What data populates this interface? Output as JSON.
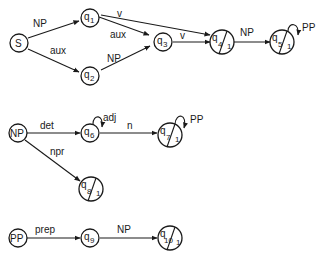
{
  "diagram": {
    "type": "augmented transition network",
    "networks": [
      {
        "name": "S",
        "nodes": [
          {
            "id": "S",
            "label": "S",
            "final": false
          },
          {
            "id": "q1",
            "label": "q",
            "sub": "1",
            "final": false
          },
          {
            "id": "q2",
            "label": "q",
            "sub": "2",
            "final": false
          },
          {
            "id": "q3",
            "label": "q",
            "sub": "3",
            "final": false
          },
          {
            "id": "q4",
            "label": "q",
            "sub": "4",
            "final": true,
            "final_mark": "1"
          },
          {
            "id": "q5",
            "label": "q",
            "sub": "5",
            "final": true,
            "final_mark": "1"
          }
        ],
        "edges": [
          {
            "from": "S",
            "to": "q1",
            "label": "NP"
          },
          {
            "from": "S",
            "to": "q2",
            "label": "aux"
          },
          {
            "from": "q1",
            "to": "q4",
            "label": "v"
          },
          {
            "from": "q1",
            "to": "q3",
            "label": "aux"
          },
          {
            "from": "q2",
            "to": "q3",
            "label": "NP"
          },
          {
            "from": "q3",
            "to": "q4",
            "label": "v"
          },
          {
            "from": "q4",
            "to": "q5",
            "label": "NP"
          },
          {
            "from": "q5",
            "to": "q5",
            "label": "PP"
          }
        ]
      },
      {
        "name": "NP",
        "nodes": [
          {
            "id": "NP",
            "label": "NP",
            "final": false
          },
          {
            "id": "q6",
            "label": "q",
            "sub": "6",
            "final": false
          },
          {
            "id": "q7",
            "label": "q",
            "sub": "7",
            "final": true,
            "final_mark": "1"
          },
          {
            "id": "q8",
            "label": "q",
            "sub": "8",
            "final": true,
            "final_mark": "1"
          }
        ],
        "edges": [
          {
            "from": "NP",
            "to": "q6",
            "label": "det"
          },
          {
            "from": "q6",
            "to": "q6",
            "label": "adj"
          },
          {
            "from": "q6",
            "to": "q7",
            "label": "n"
          },
          {
            "from": "q7",
            "to": "q7",
            "label": "PP"
          },
          {
            "from": "NP",
            "to": "q8",
            "label": "npr"
          }
        ]
      },
      {
        "name": "PP",
        "nodes": [
          {
            "id": "PP",
            "label": "PP",
            "final": false
          },
          {
            "id": "q9",
            "label": "q",
            "sub": "9",
            "final": false
          },
          {
            "id": "q10",
            "label": "q",
            "sub": "10",
            "final": true,
            "final_mark": "1"
          }
        ],
        "edges": [
          {
            "from": "PP",
            "to": "q9",
            "label": "prep"
          },
          {
            "from": "q9",
            "to": "q10",
            "label": "NP"
          }
        ]
      }
    ]
  },
  "labels": {
    "S": "S",
    "NP_start": "NP",
    "PP_start": "PP",
    "q": "q",
    "s1": "1",
    "s2": "2",
    "s3": "3",
    "s4": "4",
    "s5": "5",
    "s6": "6",
    "s7": "7",
    "s8": "8",
    "s9": "9",
    "s10": "10",
    "fin": "1",
    "e_S_q1": "NP",
    "e_S_q2": "aux",
    "e_q1_q4": "v",
    "e_q1_q3": "aux",
    "e_q2_q3": "NP",
    "e_q3_q4": "v",
    "e_q4_q5": "NP",
    "e_q5_loop": "PP",
    "e_NP_q6": "det",
    "e_q6_loop": "adj",
    "e_q6_q7": "n",
    "e_q7_loop": "PP",
    "e_NP_q8": "npr",
    "e_PP_q9": "prep",
    "e_q9_q10": "NP"
  }
}
